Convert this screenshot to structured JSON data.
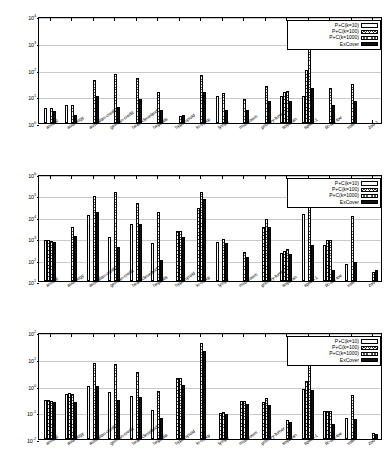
{
  "figure": {
    "panel_count": 3,
    "series_names": [
      "P+C(k=10)",
      "P+C(k=100)",
      "P+C(k=1000)",
      "ExCover"
    ],
    "series_patterns": [
      "blank",
      "x-hatch",
      "dotted",
      "solid-black"
    ],
    "categories": [
      "anneal",
      "audiology",
      "australian-credit",
      "german-credit",
      "heart-cleveland",
      "hepatitis",
      "hypothyroid",
      "kr-vs-kp",
      "lymph",
      "mushroom",
      "primary-tumor",
      "soybean",
      "splice-1",
      "tic-tac-toe",
      "vote",
      "zoo-1"
    ],
    "legend_position": "top-right"
  },
  "chart_data": [
    {
      "type": "bar",
      "title": "",
      "xlabel": "",
      "ylabel": "",
      "yscale": "log",
      "ylim": [
        1,
        10000
      ],
      "ytick_labels": [
        "10^0",
        "10^1",
        "10^2",
        "10^3",
        "10^4"
      ],
      "ytick_values": [
        1,
        10,
        100,
        1000,
        10000
      ],
      "grid": true,
      "categories": [
        "anneal",
        "audiology",
        "australian-credit",
        "german-credit",
        "heart-cleveland",
        "hepatitis",
        "hypothyroid",
        "kr-vs-kp",
        "lymph",
        "mushroom",
        "primary-tumor",
        "soybean",
        "splice-1",
        "tic-tac-toe",
        "vote",
        "zoo-1"
      ],
      "series": [
        {
          "name": "P+C(k=10)",
          "values": [
            3.8,
            4.7,
            0,
            0,
            0,
            0,
            0,
            0,
            10.0,
            0,
            0,
            10.0,
            10.0,
            0,
            0,
            0
          ]
        },
        {
          "name": "P+C(k=100)",
          "values": [
            0,
            0,
            0,
            0,
            0,
            0,
            0,
            0,
            0,
            0,
            0,
            14.5,
            100,
            0,
            0,
            0
          ]
        },
        {
          "name": "P+C(k=1000)",
          "values": [
            3.8,
            4.8,
            39,
            68,
            48,
            14.5,
            1.9,
            63,
            13,
            7.8,
            24,
            15.5,
            1050,
            21,
            28,
            0
          ]
        },
        {
          "name": "ExCover",
          "values": [
            2.9,
            2.0,
            10.0,
            4.0,
            8.0,
            3.0,
            2.0,
            14.5,
            3.0,
            3.0,
            6.8,
            6.8,
            21,
            4.6,
            6.8,
            0
          ]
        }
      ]
    },
    {
      "type": "bar",
      "title": "",
      "xlabel": "",
      "ylabel": "",
      "yscale": "log",
      "ylim": [
        10,
        1000000
      ],
      "ytick_labels": [
        "10^1",
        "10^2",
        "10^3",
        "10^4",
        "10^5",
        "10^6"
      ],
      "ytick_values": [
        10,
        100,
        1000,
        10000,
        100000,
        1000000
      ],
      "grid": true,
      "categories": [
        "anneal",
        "audiology",
        "australian-credit",
        "german-credit",
        "heart-cleveland",
        "hepatitis",
        "hypothyroid",
        "kr-vs-kp",
        "lymph",
        "mushroom",
        "primary-tumor",
        "soybean",
        "splice-1",
        "tic-tac-toe",
        "vote",
        "zoo-1"
      ],
      "series": [
        {
          "name": "P+C(k=10)",
          "values": [
            800,
            0,
            12000,
            1200,
            4800,
            580,
            0,
            0,
            700,
            0,
            0,
            210,
            13000,
            480,
            60,
            0
          ]
        },
        {
          "name": "P+C(k=100)",
          "values": [
            790,
            0,
            0,
            0,
            0,
            0,
            2100,
            25000,
            0,
            0,
            3500,
            240,
            0,
            800,
            0,
            0
          ]
        },
        {
          "name": "P+C(k=1000)",
          "values": [
            760,
            3400,
            93000,
            150000,
            42000,
            16000,
            2100,
            150000,
            900,
            220,
            8000,
            300,
            680000,
            850,
            11000,
            25
          ]
        },
        {
          "name": "ExCover",
          "values": [
            640,
            1300,
            16000,
            380,
            4400,
            92,
            1200,
            65000,
            590,
            130,
            3200,
            180,
            490,
            32,
            75,
            33
          ]
        }
      ]
    },
    {
      "type": "bar",
      "title": "",
      "xlabel": "",
      "ylabel": "",
      "yscale": "log",
      "ylim": [
        0.01,
        100
      ],
      "ytick_labels": [
        "10^-2",
        "10^-1",
        "10^0",
        "10^1",
        "10^2"
      ],
      "ytick_values": [
        0.01,
        0.1,
        1,
        10,
        100
      ],
      "grid": true,
      "categories": [
        "anneal",
        "audiology",
        "australian-credit",
        "german-credit",
        "heart-cleveland",
        "hepatitis",
        "hypothyroid",
        "kr-vs-kp",
        "lymph",
        "mushroom",
        "primary-tumor",
        "soybean",
        "splice-1",
        "tic-tac-toe",
        "vote",
        "zoo-1"
      ],
      "series": [
        {
          "name": "P+C(k=10)",
          "values": [
            0.28,
            0.5,
            1.0,
            0.55,
            0.4,
            0.12,
            0,
            0,
            0,
            0,
            0,
            0,
            0.75,
            0.11,
            0.063,
            0
          ]
        },
        {
          "name": "P+C(k=100)",
          "values": [
            0.28,
            0.51,
            0,
            0,
            0,
            0,
            1.9,
            0,
            0.093,
            0.27,
            0.24,
            0,
            1.5,
            0.11,
            0,
            0
          ]
        },
        {
          "name": "P+C(k=1000)",
          "values": [
            0.27,
            0.5,
            6.8,
            6.2,
            3.1,
            0.6,
            1.9,
            38,
            0.1,
            0.27,
            0.33,
            0.05,
            24,
            0.115,
            0.45,
            0.017
          ]
        },
        {
          "name": "ExCover",
          "values": [
            0.24,
            0.24,
            0.92,
            0.29,
            0.36,
            0.062,
            1.05,
            19,
            0.088,
            0.21,
            0.19,
            0.044,
            0.68,
            0.038,
            0.055,
            0.016
          ]
        }
      ]
    }
  ]
}
